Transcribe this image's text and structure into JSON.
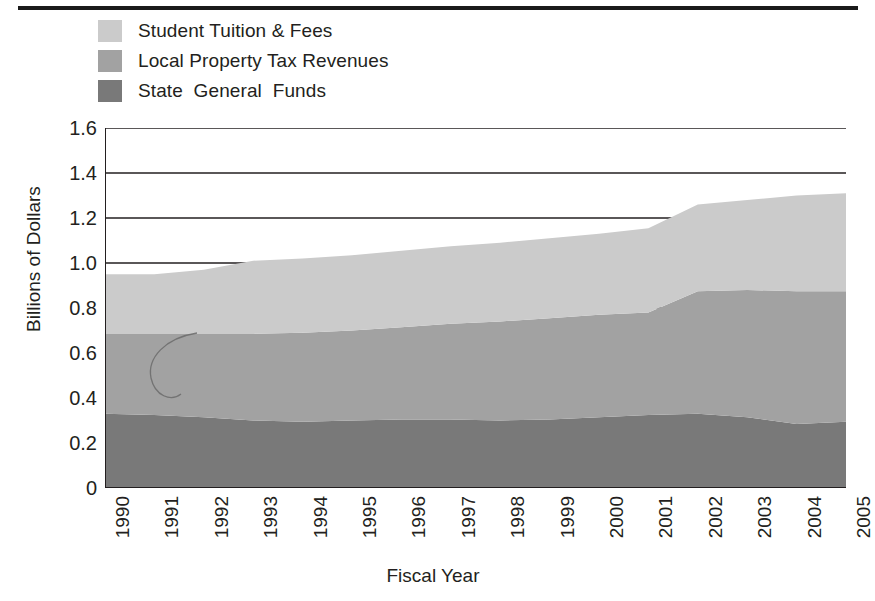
{
  "chart_data": {
    "type": "area",
    "title": "",
    "subtitle": "",
    "xlabel": "Fiscal Year",
    "ylabel": "Billions of Dollars",
    "stacked": true,
    "grid": true,
    "legend_position": "top-left",
    "categories": [
      "1990",
      "1991",
      "1992",
      "1993",
      "1994",
      "1995",
      "1996",
      "1997",
      "1998",
      "1999",
      "2000",
      "2001",
      "2002",
      "2003",
      "2004",
      "2005"
    ],
    "x": [
      1990,
      1991,
      1992,
      1993,
      1994,
      1995,
      1996,
      1997,
      1998,
      1999,
      2000,
      2001,
      2002,
      2003,
      2004,
      2005
    ],
    "xlim": [
      1990,
      2005
    ],
    "ylim": [
      0,
      1.6
    ],
    "yticks": [
      "0",
      "0.2",
      "0.4",
      "0.6",
      "0.8",
      "1.0",
      "1.2",
      "1.4",
      "1.6"
    ],
    "ytick_values": [
      0,
      0.2,
      0.4,
      0.6,
      0.8,
      1.0,
      1.2,
      1.4,
      1.6
    ],
    "series": [
      {
        "name": "State General Funds",
        "color": "#797979",
        "values": [
          0.33,
          0.325,
          0.315,
          0.3,
          0.295,
          0.3,
          0.305,
          0.305,
          0.3,
          0.305,
          0.315,
          0.325,
          0.33,
          0.315,
          0.285,
          0.295
        ]
      },
      {
        "name": "Local Property Tax Revenues",
        "color": "#a2a2a2",
        "values": [
          0.355,
          0.36,
          0.37,
          0.385,
          0.395,
          0.4,
          0.41,
          0.425,
          0.44,
          0.45,
          0.455,
          0.455,
          0.545,
          0.565,
          0.59,
          0.58
        ]
      },
      {
        "name": "Student Tuition & Fees",
        "color": "#cbcbcb",
        "values": [
          0.265,
          0.265,
          0.285,
          0.325,
          0.33,
          0.335,
          0.34,
          0.345,
          0.35,
          0.355,
          0.36,
          0.375,
          0.385,
          0.4,
          0.425,
          0.435
        ]
      }
    ],
    "cumulative_tops": {
      "State General Funds": [
        0.33,
        0.325,
        0.315,
        0.3,
        0.295,
        0.3,
        0.305,
        0.305,
        0.3,
        0.305,
        0.315,
        0.325,
        0.33,
        0.315,
        0.285,
        0.295
      ],
      "Local Property Tax Revenues": [
        0.685,
        0.685,
        0.685,
        0.685,
        0.69,
        0.7,
        0.715,
        0.73,
        0.74,
        0.755,
        0.77,
        0.78,
        0.875,
        0.88,
        0.875,
        0.875
      ],
      "Student Tuition & Fees": [
        0.95,
        0.95,
        0.97,
        1.01,
        1.02,
        1.035,
        1.055,
        1.075,
        1.09,
        1.11,
        1.13,
        1.155,
        1.26,
        1.28,
        1.3,
        1.31
      ]
    }
  },
  "legend": {
    "items": [
      {
        "label": "Student Tuition & Fees",
        "color": "#cbcbcb"
      },
      {
        "label": "Local Property Tax Revenues",
        "color": "#a2a2a2"
      },
      {
        "label": "State  General  Funds",
        "color": "#797979"
      }
    ]
  },
  "axes": {
    "y_title": "Billions of Dollars",
    "x_title": "Fiscal Year",
    "y_ticks": [
      "1.6",
      "1.4",
      "1.2",
      "1.0",
      "0.8",
      "0.6",
      "0.4",
      "0.2",
      "0"
    ],
    "x_ticks": [
      "1990",
      "1991",
      "1992",
      "1993",
      "1994",
      "1995",
      "1996",
      "1997",
      "1998",
      "1999",
      "2000",
      "2001",
      "2002",
      "2003",
      "2004",
      "2005"
    ]
  },
  "colors": {
    "tuition": "#cbcbcb",
    "property_tax": "#a2a2a2",
    "general_funds": "#797979",
    "axis": "#231f20",
    "rule": "#1a1a1a",
    "background": "#ffffff"
  }
}
